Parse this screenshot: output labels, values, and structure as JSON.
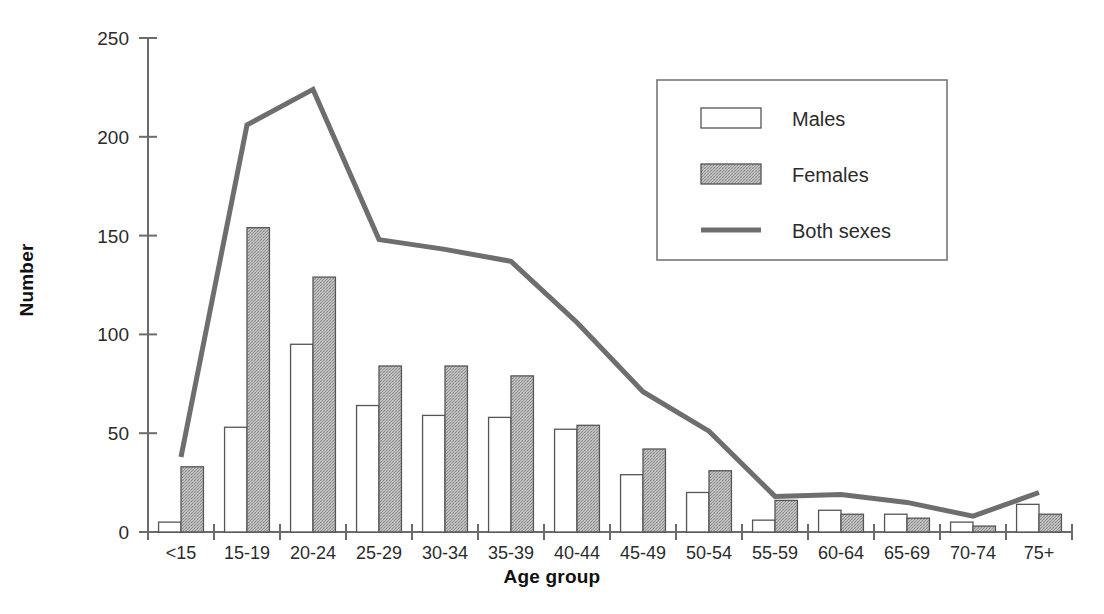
{
  "chart_data": {
    "type": "bar",
    "title": "",
    "subtitle": "",
    "xlabel": "Age group",
    "ylabel": "Number",
    "ylim": [
      0,
      250
    ],
    "yticks": [
      0,
      50,
      100,
      150,
      200,
      250
    ],
    "ytick_labels": [
      "0",
      "50",
      "100",
      "150",
      "200",
      "250"
    ],
    "grid": false,
    "legend_position": "top-right",
    "categories": [
      "<15",
      "15-19",
      "20-24",
      "25-29",
      "30-34",
      "35-39",
      "40-44",
      "45-49",
      "50-54",
      "55-59",
      "60-64",
      "65-69",
      "70-74",
      "75+"
    ],
    "series": [
      {
        "name": "Males",
        "render": "bar",
        "fill": "#ffffff",
        "stroke": "#555555",
        "values": [
          5,
          53,
          95,
          64,
          59,
          58,
          52,
          29,
          20,
          6,
          11,
          9,
          5,
          14
        ]
      },
      {
        "name": "Females",
        "render": "bar-hatched",
        "fill": "#bdbdbd",
        "stroke": "#555555",
        "values": [
          33,
          154,
          129,
          84,
          84,
          79,
          54,
          42,
          31,
          16,
          9,
          7,
          3,
          9
        ]
      },
      {
        "name": "Both sexes",
        "render": "line",
        "stroke": "#6e6e6e",
        "values": [
          38,
          206,
          224,
          148,
          143,
          137,
          106,
          71,
          51,
          18,
          19,
          15,
          8,
          20
        ]
      }
    ]
  },
  "legend": {
    "items": [
      {
        "label": "Males",
        "swatch": "open-rect"
      },
      {
        "label": "Females",
        "swatch": "hatched-rect"
      },
      {
        "label": "Both sexes",
        "swatch": "line"
      }
    ]
  },
  "axes": {
    "y_title": "Number",
    "x_title": "Age group"
  },
  "colors": {
    "axis": "#6b6b6b",
    "bar_stroke": "#555555",
    "male_fill": "#ffffff",
    "female_fill": "#bdbdbd",
    "line": "#6e6e6e",
    "text": "#2b2b2b",
    "title_text": "#111111",
    "background": "#ffffff"
  }
}
